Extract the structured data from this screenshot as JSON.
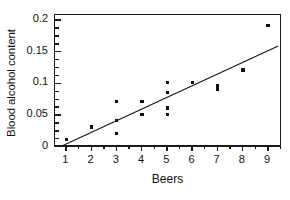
{
  "chart_data": {
    "type": "scatter",
    "title": "",
    "xlabel": "Beers",
    "ylabel": "Blood alcohol content",
    "xlim": [
      0.55,
      9.55
    ],
    "ylim": [
      0,
      0.207
    ],
    "grid": false,
    "legend": null,
    "x_ticks": [
      1,
      2,
      3,
      4,
      5,
      6,
      7,
      8,
      9
    ],
    "x_tick_labels": [
      "1",
      "2",
      "3",
      "4",
      "5",
      "6",
      "7",
      "8",
      "9"
    ],
    "x_minor_ticks": [
      1.5,
      2.5,
      3.5,
      4.5,
      5.5,
      6.5,
      7.5,
      8.5,
      9.5
    ],
    "y_ticks": [
      0,
      0.05,
      0.1,
      0.15,
      0.2
    ],
    "y_tick_labels": [
      "0",
      "0.05",
      "0.1",
      "0.15",
      "0.2"
    ],
    "y_minor_ticks": [
      0.0125,
      0.025,
      0.0375,
      0.0625,
      0.075,
      0.0875,
      0.1125,
      0.125,
      0.1375,
      0.1625,
      0.175,
      0.1875
    ],
    "marker": "square",
    "marker_color": "#111111",
    "axis_color": "#1a1a1a",
    "line_color": "#1a1a1a",
    "points": [
      {
        "x": 1,
        "y": 0.01
      },
      {
        "x": 2,
        "y": 0.03
      },
      {
        "x": 3,
        "y": 0.07
      },
      {
        "x": 3,
        "y": 0.04
      },
      {
        "x": 3,
        "y": 0.02
      },
      {
        "x": 4,
        "y": 0.07
      },
      {
        "x": 4,
        "y": 0.05
      },
      {
        "x": 5,
        "y": 0.1
      },
      {
        "x": 5,
        "y": 0.085
      },
      {
        "x": 5,
        "y": 0.06
      },
      {
        "x": 5,
        "y": 0.05
      },
      {
        "x": 6,
        "y": 0.1
      },
      {
        "x": 7,
        "y": 0.095
      },
      {
        "x": 7,
        "y": 0.09
      },
      {
        "x": 8,
        "y": 0.12
      },
      {
        "x": 9,
        "y": 0.19
      }
    ],
    "fit_line": {
      "name": "least-squares regression line",
      "x_start": 0.82,
      "y_start": 0.0,
      "x_end": 9.4,
      "y_end": 0.158
    }
  }
}
